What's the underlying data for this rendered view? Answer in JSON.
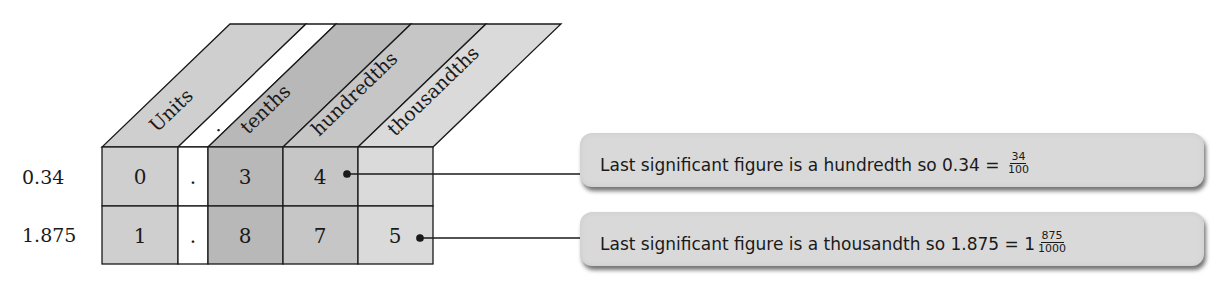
{
  "diagram": {
    "headers": [
      {
        "label": "Units",
        "fill": "#cfcfcf"
      },
      {
        "label": ".",
        "fill": "#ffffff"
      },
      {
        "label": "tenths",
        "fill": "#b8b8b8"
      },
      {
        "label": "hundredths",
        "fill": "#c6c6c6"
      },
      {
        "label": "thousandths",
        "fill": "#dadada"
      }
    ],
    "rows": [
      {
        "label": "0.34",
        "cells": [
          "0",
          ".",
          "3",
          "4",
          ""
        ]
      },
      {
        "label": "1.875",
        "cells": [
          "1",
          ".",
          "8",
          "7",
          "5"
        ]
      }
    ],
    "line_color": "#1a1a1a"
  },
  "callouts": [
    {
      "text": "Last significant figure is a hundredth so 0.34 = ",
      "whole": "",
      "numerator": "34",
      "denominator": "100"
    },
    {
      "text": "Last significant figure is a thousandth so 1.875 = ",
      "whole": "1",
      "numerator": "875",
      "denominator": "1000"
    }
  ]
}
